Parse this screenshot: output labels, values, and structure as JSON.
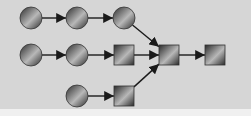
{
  "diagram": {
    "type": "flow-graph",
    "colors": {
      "background": "#d6d6d6",
      "node_dark": "#2b2b2b",
      "node_light": "#b8b8b8",
      "edge": "#1a1a1a"
    },
    "nodes": [
      {
        "id": "c1",
        "shape": "circle",
        "x": 31,
        "y": 18
      },
      {
        "id": "c2",
        "shape": "circle",
        "x": 77,
        "y": 18
      },
      {
        "id": "c3",
        "shape": "circle",
        "x": 124,
        "y": 18
      },
      {
        "id": "c4",
        "shape": "circle",
        "x": 31,
        "y": 55
      },
      {
        "id": "c5",
        "shape": "circle",
        "x": 77,
        "y": 55
      },
      {
        "id": "s1",
        "shape": "square",
        "x": 124,
        "y": 55
      },
      {
        "id": "s2",
        "shape": "square",
        "x": 169,
        "y": 55
      },
      {
        "id": "s3",
        "shape": "square",
        "x": 215,
        "y": 55
      },
      {
        "id": "c6",
        "shape": "circle",
        "x": 77,
        "y": 96
      },
      {
        "id": "s4",
        "shape": "square",
        "x": 124,
        "y": 96
      }
    ],
    "edges": [
      {
        "from": "c1",
        "to": "c2"
      },
      {
        "from": "c2",
        "to": "c3"
      },
      {
        "from": "c3",
        "to": "s2"
      },
      {
        "from": "c4",
        "to": "c5"
      },
      {
        "from": "c5",
        "to": "s1"
      },
      {
        "from": "s1",
        "to": "s2"
      },
      {
        "from": "s2",
        "to": "s3"
      },
      {
        "from": "c6",
        "to": "s4"
      },
      {
        "from": "s4",
        "to": "s2"
      }
    ]
  }
}
